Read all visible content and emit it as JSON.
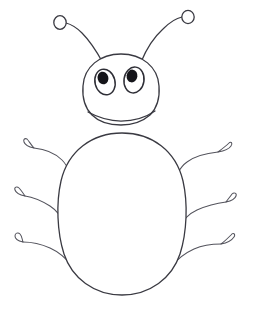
{
  "artwork": {
    "title": "Cartoon Bug Line Drawing",
    "subject": "bug",
    "style": "hand-drawn black ink line art",
    "background_color": "#ffffff",
    "ink_color": "#3a3a42",
    "pupil_color": "#15151a",
    "canvas": {
      "width": 254,
      "height": 310
    },
    "caption": ""
  },
  "parts": {
    "head": {
      "name": "head",
      "shape": "rounded dome oval",
      "center": {
        "x": 121,
        "y": 86
      },
      "radius_x": 39,
      "radius_y": 32
    },
    "body": {
      "name": "abdomen",
      "shape": "large vertical oval",
      "center": {
        "x": 122,
        "y": 214
      },
      "radius_x": 62,
      "radius_y": 82
    },
    "eyes": [
      {
        "name": "left-eye",
        "center": {
          "x": 105,
          "y": 82
        },
        "radius_x": 10,
        "radius_y": 13,
        "rotation": -14,
        "pupil": {
          "x": 103,
          "y": 78,
          "radius_x": 5.4,
          "radius_y": 6.4
        }
      },
      {
        "name": "right-eye",
        "center": {
          "x": 134,
          "y": 80
        },
        "radius_x": 10,
        "radius_y": 13,
        "rotation": 8,
        "pupil": {
          "x": 132,
          "y": 76,
          "radius_x": 5.4,
          "radius_y": 6.4
        }
      }
    ],
    "antennae": [
      {
        "name": "left-antenna",
        "side": "left",
        "base": {
          "x": 101,
          "y": 61
        },
        "tip_circle": {
          "x": 60,
          "y": 23,
          "radius": 6
        }
      },
      {
        "name": "right-antenna",
        "side": "right",
        "base": {
          "x": 142,
          "y": 60
        },
        "tip_circle": {
          "x": 188,
          "y": 17,
          "radius": 6
        }
      }
    ],
    "legs": [
      {
        "name": "left-front-leg",
        "side": "left",
        "index": 1,
        "foot": "hook"
      },
      {
        "name": "left-middle-leg",
        "side": "left",
        "index": 2,
        "foot": "hook"
      },
      {
        "name": "left-rear-leg",
        "side": "left",
        "index": 3,
        "foot": "hook"
      },
      {
        "name": "right-front-leg",
        "side": "right",
        "index": 1,
        "foot": "hook"
      },
      {
        "name": "right-middle-leg",
        "side": "right",
        "index": 2,
        "foot": "hook"
      },
      {
        "name": "right-rear-leg",
        "side": "right",
        "index": 3,
        "foot": "hook"
      }
    ],
    "counts": {
      "antennae": 2,
      "eyes": 2,
      "legs": 6
    }
  }
}
